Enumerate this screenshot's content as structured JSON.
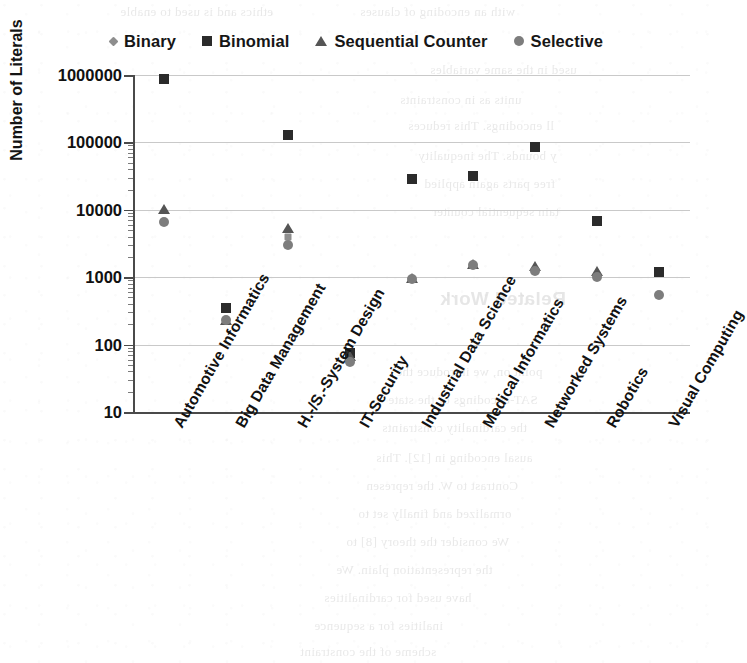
{
  "chart_data": {
    "type": "scatter",
    "title": "",
    "xlabel": "",
    "ylabel": "Number of Literals",
    "yscale": "log",
    "ylim": [
      10,
      1000000
    ],
    "ytick_labels": [
      "1000000",
      "100000",
      "10000",
      "1000",
      "100",
      "10"
    ],
    "ytick_values": [
      1000000,
      100000,
      10000,
      1000,
      100,
      10
    ],
    "grid": true,
    "legend_position": "top",
    "categories": [
      "Automotive Informatics",
      "Big Data Management",
      "H.-/S.-System Design",
      "IT-Security",
      "Industrial Data Science",
      "Medical Informatics",
      "Networked Systems",
      "Robotics",
      "Visual Computing"
    ],
    "series": [
      {
        "name": "Binary",
        "marker": "diamond",
        "color": "#8e8e8e",
        "values": [
          null,
          null,
          4000,
          65,
          null,
          null,
          null,
          null,
          null
        ]
      },
      {
        "name": "Binomial",
        "marker": "square",
        "color": "#2b2b2b",
        "values": [
          880000,
          350,
          130000,
          75,
          29000,
          32000,
          85000,
          6800,
          1200
        ]
      },
      {
        "name": "Sequential Counter",
        "marker": "triangle",
        "color": "#555555",
        "values": [
          10500,
          240,
          5500,
          70,
          1000,
          1600,
          1500,
          1300,
          null
        ]
      },
      {
        "name": "Selective",
        "marker": "circle",
        "color": "#7d7d7d",
        "values": [
          6500,
          230,
          3000,
          55,
          950,
          1500,
          1250,
          1000,
          550
        ]
      }
    ]
  },
  "legend": {
    "items": [
      {
        "label": "Binary",
        "marker": "binary-marker-icon"
      },
      {
        "label": "Binomial",
        "marker": "binomial-marker-icon"
      },
      {
        "label": "Sequential Counter",
        "marker": "sequential-counter-marker-icon"
      },
      {
        "label": "Selective",
        "marker": "selective-marker-icon"
      }
    ]
  },
  "axes": {
    "y_title": "Number of Literals"
  },
  "scan_bleed": {
    "lines": [
      {
        "text": "ethics and is used to enable",
        "x": 120,
        "y": 4,
        "size": 13
      },
      {
        "text": "with an encoding of clauses",
        "x": 360,
        "y": 4,
        "size": 13
      },
      {
        "text": "used in the same variables",
        "x": 430,
        "y": 62,
        "size": 13
      },
      {
        "text": "units as in constraints",
        "x": 400,
        "y": 92,
        "size": 13
      },
      {
        "text": "ll encodings. This reduces",
        "x": 408,
        "y": 118,
        "size": 13
      },
      {
        "text": "y bounds. The inequality",
        "x": 418,
        "y": 148,
        "size": 13
      },
      {
        "text": "free parts again applied",
        "x": 424,
        "y": 176,
        "size": 13
      },
      {
        "text": "tain sequential counter",
        "x": 432,
        "y": 204,
        "size": 13
      },
      {
        "text": "Related Work",
        "x": 440,
        "y": 288,
        "size": 19,
        "head": true
      },
      {
        "text": "point on, we introduce the",
        "x": 396,
        "y": 364,
        "size": 13
      },
      {
        "text": "SAT-encodings of the state",
        "x": 388,
        "y": 392,
        "size": 13
      },
      {
        "text": "the cardinality constraints",
        "x": 382,
        "y": 420,
        "size": 13
      },
      {
        "text": "ausal encoding in [12]. This",
        "x": 376,
        "y": 450,
        "size": 13
      },
      {
        "text": "Contrast to W. the represen",
        "x": 366,
        "y": 478,
        "size": 13
      },
      {
        "text": "ormalized and finally set to",
        "x": 358,
        "y": 506,
        "size": 13
      },
      {
        "text": "We consider the theory [8] to",
        "x": 346,
        "y": 534,
        "size": 13
      },
      {
        "text": "the representation plain. We",
        "x": 336,
        "y": 562,
        "size": 13
      },
      {
        "text": "have used for cardinalities",
        "x": 324,
        "y": 590,
        "size": 13
      },
      {
        "text": "inalities for a sequence",
        "x": 314,
        "y": 618,
        "size": 13
      },
      {
        "text": "scheme of the constraint",
        "x": 300,
        "y": 644,
        "size": 13
      }
    ]
  }
}
